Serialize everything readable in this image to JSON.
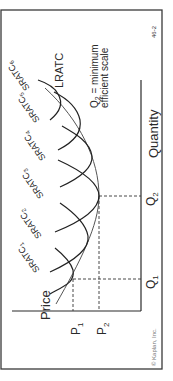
{
  "diagram": {
    "orientation": "rotated 90 degrees counter-clockwise",
    "axes": {
      "y_label": "Price",
      "x_label": "Quantity"
    },
    "ticks": {
      "price": [
        {
          "main": "P",
          "sub": "1"
        },
        {
          "main": "P",
          "sub": "2"
        }
      ],
      "quantity": [
        {
          "main": "Q",
          "sub": "1"
        },
        {
          "main": "Q",
          "sub": "2"
        }
      ]
    },
    "curves": {
      "long_run": "LRATC",
      "short_run": [
        {
          "main": "SRATC",
          "sub": "1"
        },
        {
          "main": "SRATC",
          "sub": "2"
        },
        {
          "main": "SRATC",
          "sub": "3"
        },
        {
          "main": "SRATC",
          "sub": "4"
        },
        {
          "main": "SRATC",
          "sub": "5"
        },
        {
          "main": "SRATC",
          "sub": "6"
        }
      ]
    },
    "annotation": {
      "line1_main": "Q",
      "line1_sub": "2",
      "line1_rest": " = minimum",
      "line2": "efficient scale"
    },
    "figure_number": "46-2",
    "copyright": "© Kaplan, Inc.",
    "colors": {
      "frame": "#3a3a3a",
      "axis": "#2a2a2a",
      "curve": "#222222",
      "lratc": "#555555",
      "text": "#2a2a2a"
    }
  }
}
